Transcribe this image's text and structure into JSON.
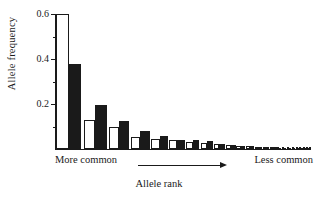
{
  "chart_data": {
    "type": "bar",
    "title": "",
    "subtitle": "",
    "xlabel": "Allele rank",
    "ylabel": "Allele frequency",
    "ylim": [
      0,
      0.6
    ],
    "xlim_note": "Allele rank, ordered from most to least common",
    "grid": false,
    "legend_position": "none",
    "y_major_ticks": [
      0.2,
      0.4,
      0.6
    ],
    "y_major_tick_labels": [
      "0.2",
      "0.4",
      "0.6"
    ],
    "y_minor_ticks": [
      0.1,
      0.3,
      0.5
    ],
    "x_axis_annotations": {
      "left": "More common",
      "right": "Less common",
      "arrow": "right-arrow"
    },
    "categories": [
      1,
      2,
      3,
      4,
      5,
      6,
      7,
      8,
      9,
      10,
      11,
      12,
      13,
      14,
      15,
      16,
      17,
      18,
      19,
      20,
      21,
      22,
      23,
      24
    ],
    "series": [
      {
        "name": "white-bars",
        "fill": "white",
        "values": [
          0.6,
          0.13,
          0.1,
          0.055,
          0.045,
          0.038,
          0.03,
          0.026,
          0.022,
          0.018,
          0.015,
          0.013,
          0.011,
          0.009,
          0.008,
          0.007,
          0.006,
          0.005,
          0.004,
          0.004,
          0.003,
          0.003,
          0.002,
          0.002
        ]
      },
      {
        "name": "black-bars",
        "fill": "black",
        "values": [
          0.38,
          0.195,
          0.125,
          0.078,
          0.058,
          0.042,
          0.04,
          0.034,
          0.021,
          0.02,
          0.014,
          0.012,
          0.01,
          0.008,
          0.007,
          0.006,
          0.005,
          0.004,
          0.004,
          0.003,
          0.003,
          0.002,
          0.002,
          0.002
        ]
      }
    ]
  },
  "axis": {
    "y_label": "Allele frequency",
    "x_label": "Allele rank",
    "tick_0_6": "0.6",
    "tick_0_4": "0.4",
    "tick_0_2": "0.2"
  },
  "annotations": {
    "more_common": "More common",
    "less_common": "Less common"
  },
  "colors": {
    "ink": "#1a1a1a",
    "background": "#ffffff",
    "bar_fill_black": "#1a1a1a",
    "bar_fill_white": "#ffffff"
  }
}
